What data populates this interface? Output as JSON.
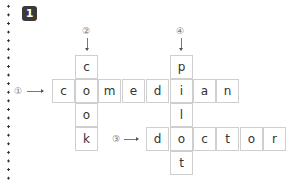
{
  "badge": "1",
  "clues": {
    "c1": "①",
    "c2": "②",
    "c3": "③",
    "c4": "④"
  },
  "words": {
    "across_1": "comedian",
    "down_2": "cook",
    "across_3": "doctor",
    "down_4": "pilot"
  },
  "cells": {
    "d2_0": "c",
    "a1_0": "c",
    "a1_1": "o",
    "a1_2": "m",
    "a1_3": "e",
    "a1_4": "d",
    "a1_5": "i",
    "a1_6": "a",
    "a1_7": "n",
    "d2_2": "o",
    "d2_3": "k",
    "d4_0": "p",
    "d4_2": "l",
    "d4_4": "t",
    "a3_0": "d",
    "a3_1": "o",
    "a3_2": "c",
    "a3_3": "t",
    "a3_4": "o",
    "a3_5": "r"
  }
}
